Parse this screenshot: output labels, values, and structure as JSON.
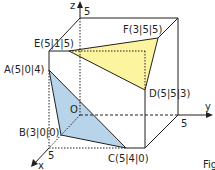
{
  "diagram": {
    "type": "3d-cube-coordinate-system",
    "axes": {
      "x": {
        "label": "x",
        "tick": "5"
      },
      "y": {
        "label": "y",
        "tick": "5"
      },
      "z": {
        "label": "z",
        "tick": "5"
      }
    },
    "origin_label": "O",
    "points": {
      "A": "A(5|0|4)",
      "B": "B(3|0|0)",
      "C": "C(5|4|0)",
      "D": "D(5|5|3)",
      "E": "E(5|1|5)",
      "F": "F(3|5|5)"
    },
    "triangles": [
      {
        "name": "ABC",
        "color": "#b8d4ea"
      },
      {
        "name": "DEF",
        "color": "#fdf4a0"
      }
    ],
    "caption_fragment": "Fig"
  }
}
